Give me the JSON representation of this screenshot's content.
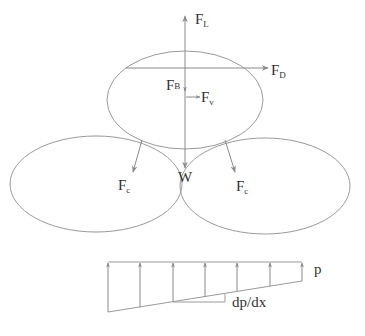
{
  "diagram": {
    "type": "free-body force diagram on particle with pressure gradient",
    "colors": {
      "stroke": "#9a9a9a",
      "text": "#333333",
      "background": "#ffffff"
    },
    "forces": {
      "lift": {
        "main": "F",
        "sub": "L"
      },
      "drag": {
        "main": "F",
        "sub": "D"
      },
      "buoyancy": {
        "main": "F",
        "sub": "B"
      },
      "virtual_mass": {
        "main": "F",
        "sub": "v"
      },
      "contact_left": {
        "main": "F",
        "sub": "c"
      },
      "contact_right": {
        "main": "F",
        "sub": "c"
      },
      "weight": {
        "main": "W"
      }
    },
    "pressure": {
      "label": "p",
      "gradient_label": "dp/dx",
      "arrow_count": 7
    }
  }
}
